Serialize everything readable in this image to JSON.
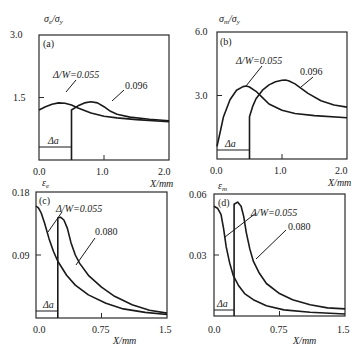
{
  "chart_data": [
    {
      "panel": "(a)",
      "type": "line",
      "ylabel": "σe/σy",
      "xlabel": "X/mm",
      "xlim": [
        0,
        2.0
      ],
      "ylim": [
        0,
        3.0
      ],
      "xticks": [
        "0.0",
        "1.0",
        "2.0"
      ],
      "yticks": [
        "1.5",
        "3.0"
      ],
      "annotation_delta_a": "Δa",
      "delta_a_range": [
        0,
        0.5
      ],
      "series": [
        {
          "name": "Δ/W=0.055",
          "label": "Δ/W=0.055",
          "x": [
            0,
            0.1,
            0.2,
            0.3,
            0.4,
            0.5,
            0.6,
            0.8,
            1.0,
            1.2,
            1.5,
            2.0
          ],
          "y": [
            1.2,
            1.28,
            1.34,
            1.37,
            1.36,
            1.32,
            1.25,
            1.13,
            1.05,
            1.01,
            0.97,
            0.92
          ]
        },
        {
          "name": "Δ/W=0.096",
          "label": "0.096",
          "x": [
            0.5,
            0.5,
            0.6,
            0.7,
            0.8,
            0.9,
            1.0,
            1.1,
            1.2,
            1.4,
            1.7,
            2.0
          ],
          "y": [
            0,
            1.2,
            1.3,
            1.37,
            1.4,
            1.37,
            1.28,
            1.17,
            1.1,
            1.03,
            0.98,
            0.94
          ]
        }
      ]
    },
    {
      "panel": "(b)",
      "type": "line",
      "ylabel": "σm/σy",
      "xlabel": "X/mm",
      "xlim": [
        0,
        2.0
      ],
      "ylim": [
        0,
        6.0
      ],
      "xticks": [
        "0.0",
        "1.0",
        "2.0"
      ],
      "yticks": [
        "3.0",
        "6.0"
      ],
      "annotation_delta_a": "Δa",
      "delta_a_range": [
        0,
        0.5
      ],
      "series": [
        {
          "name": "Δ/W=0.055",
          "label": "Δ/W=0.055",
          "x": [
            0,
            0.05,
            0.1,
            0.2,
            0.3,
            0.4,
            0.45,
            0.5,
            0.6,
            0.7,
            0.8,
            1.0,
            1.2,
            1.5,
            2.0
          ],
          "y": [
            0.6,
            1.3,
            2.0,
            2.8,
            3.25,
            3.42,
            3.45,
            3.4,
            3.2,
            2.9,
            2.6,
            2.3,
            2.15,
            2.05,
            1.95
          ]
        },
        {
          "name": "Δ/W=0.096",
          "label": "0.096",
          "x": [
            0.5,
            0.5,
            0.55,
            0.6,
            0.7,
            0.8,
            0.9,
            1.0,
            1.05,
            1.1,
            1.2,
            1.4,
            1.6,
            1.8,
            2.0
          ],
          "y": [
            0,
            2.0,
            2.5,
            2.85,
            3.25,
            3.5,
            3.65,
            3.72,
            3.73,
            3.7,
            3.55,
            3.1,
            2.75,
            2.55,
            2.45
          ]
        }
      ]
    },
    {
      "panel": "(c)",
      "type": "line",
      "ylabel": "εe",
      "xlabel": "X/mm",
      "xlim": [
        0,
        1.5
      ],
      "ylim": [
        0,
        0.18
      ],
      "xticks": [
        "0.0",
        "0.75",
        "1.5"
      ],
      "yticks": [
        "0.09",
        "0.18"
      ],
      "annotation_delta_a": "Δa",
      "delta_a_range": [
        0,
        0.25
      ],
      "series": [
        {
          "name": "Δ/W=0.055",
          "label": "Δ/W=0.055",
          "x": [
            0,
            0.03,
            0.06,
            0.1,
            0.15,
            0.2,
            0.25,
            0.35,
            0.45,
            0.6,
            0.8,
            1.0,
            1.25,
            1.5
          ],
          "y": [
            0.16,
            0.157,
            0.15,
            0.135,
            0.113,
            0.095,
            0.081,
            0.061,
            0.047,
            0.033,
            0.021,
            0.013,
            0.008,
            0.005
          ]
        },
        {
          "name": "Δ/W=0.080",
          "label": "0.080",
          "x": [
            0.25,
            0.25,
            0.28,
            0.32,
            0.36,
            0.4,
            0.45,
            0.5,
            0.6,
            0.75,
            0.9,
            1.1,
            1.3,
            1.5
          ],
          "y": [
            0,
            0.143,
            0.144,
            0.14,
            0.128,
            0.108,
            0.09,
            0.078,
            0.061,
            0.044,
            0.031,
            0.019,
            0.011,
            0.007
          ]
        }
      ]
    },
    {
      "panel": "(d)",
      "type": "line",
      "ylabel": "εm",
      "xlabel": "X/mm",
      "xlim": [
        0,
        1.5
      ],
      "ylim": [
        0,
        0.06
      ],
      "xticks": [
        "0.0",
        "0.75",
        "1.5"
      ],
      "yticks": [
        "0.03",
        "0.06"
      ],
      "annotation_delta_a": "Δa",
      "delta_a_range": [
        0,
        0.23
      ],
      "series": [
        {
          "name": "Δ/W=0.055",
          "label": "Δ/W=0.055",
          "x": [
            0,
            0.04,
            0.08,
            0.11,
            0.14,
            0.18,
            0.22,
            0.28,
            0.35,
            0.45,
            0.6,
            0.8,
            1.1,
            1.5
          ],
          "y": [
            0.054,
            0.053,
            0.05,
            0.043,
            0.034,
            0.026,
            0.02,
            0.015,
            0.011,
            0.008,
            0.005,
            0.003,
            0.0018,
            0.001
          ]
        },
        {
          "name": "Δ/W=0.080",
          "label": "0.080",
          "x": [
            0.23,
            0.23,
            0.27,
            0.31,
            0.34,
            0.37,
            0.41,
            0.45,
            0.52,
            0.6,
            0.75,
            0.9,
            1.1,
            1.3,
            1.5
          ],
          "y": [
            0,
            0.055,
            0.056,
            0.054,
            0.049,
            0.041,
            0.033,
            0.027,
            0.021,
            0.016,
            0.011,
            0.008,
            0.0055,
            0.004,
            0.0035
          ]
        }
      ]
    }
  ],
  "labels": {
    "a": {
      "tag": "(a)",
      "ylabel_main": "σ",
      "ylabel_sub1": "e",
      "ylabel_sub2": "y",
      "ymax": "3.0",
      "ymid": "1.5",
      "x0": "0.0",
      "x1": "1.0",
      "x2": "2.0",
      "xlabel": "X/mm",
      "s1": "Δ/W=0.055",
      "s2": "0.096",
      "da": "Δa"
    },
    "b": {
      "tag": "(b)",
      "ylabel_main": "σ",
      "ylabel_sub1": "m",
      "ylabel_sub2": "y",
      "ymax": "6.0",
      "ymid": "3.0",
      "x0": "0.0",
      "x1": "1.0",
      "x2": "2.0",
      "xlabel": "X/mm",
      "s1": "Δ/W=0.055",
      "s2": "0.096",
      "da": "Δa"
    },
    "c": {
      "tag": "(c)",
      "ylabel_main": "ε",
      "ylabel_sub1": "e",
      "ymax": "0.18",
      "ymid": "0.09",
      "x0": "0.0",
      "x1": "0.75",
      "x2": "1.5",
      "xlabel": "X/mm",
      "s1": "Δ/W=0.055",
      "s2": "0.080",
      "da": "Δa"
    },
    "d": {
      "tag": "(d)",
      "ylabel_main": "ε",
      "ylabel_sub1": "m",
      "ymax": "0.06",
      "ymid": "0.03",
      "x0": "0.0",
      "x1": "0.75",
      "x2": "1.5",
      "xlabel": "X/mm",
      "s1": "Δ/W=0.055",
      "s2": "0.080",
      "da": "Δa"
    }
  }
}
